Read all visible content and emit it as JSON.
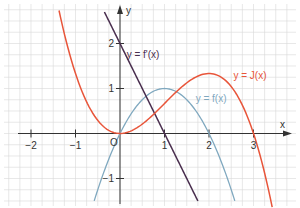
{
  "chart_data": {
    "type": "line",
    "title": "",
    "xlabel": "x",
    "ylabel": "y",
    "origin_label": "O",
    "xlim": [
      -2.4,
      3.7
    ],
    "ylim": [
      -1.6,
      2.6
    ],
    "grid": true,
    "grid_minor_step": 0.25,
    "x_ticks": [
      -2,
      -1,
      1,
      2,
      3
    ],
    "x_tick_labels": [
      "−2",
      "−1",
      "1",
      "2",
      "3"
    ],
    "y_ticks": [
      -1,
      1,
      2
    ],
    "y_tick_labels": [
      "−1",
      "1",
      "2"
    ],
    "series": [
      {
        "name": "y = f(x)",
        "formula": "2x − x²",
        "color": "#7fa8bf",
        "x_range": [
          -0.58,
          2.58
        ],
        "key_points": [
          [
            0,
            0
          ],
          [
            1,
            1
          ],
          [
            2,
            0
          ]
        ]
      },
      {
        "name": "y = f'(x)",
        "formula": "2 − 2x",
        "color": "#4a2f4f",
        "x_range": [
          -0.35,
          1.75
        ],
        "key_points": [
          [
            0,
            2
          ],
          [
            1,
            0
          ]
        ]
      },
      {
        "name": "y = J(x)",
        "formula": "x² − x³/3",
        "color": "#e8553a",
        "x_range": [
          -1.37,
          3.42
        ],
        "key_points": [
          [
            0,
            0
          ],
          [
            2,
            1.333
          ],
          [
            3,
            0
          ]
        ]
      }
    ],
    "annotations": [
      {
        "text": "y = f'(x)",
        "x": 0.15,
        "y": 1.75
      },
      {
        "text": "y = J(x)",
        "x": 2.55,
        "y": 1.3
      },
      {
        "text": "y = f(x)",
        "x": 1.7,
        "y": 0.78
      }
    ]
  }
}
